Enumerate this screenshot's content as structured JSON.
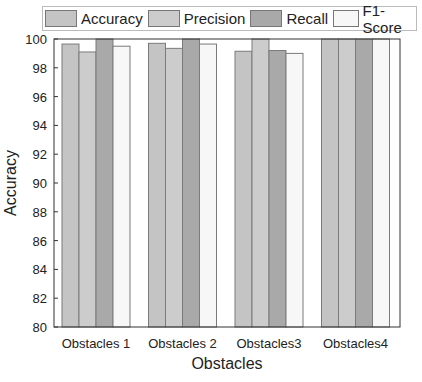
{
  "chart_data": {
    "type": "bar",
    "title": "",
    "xlabel": "Obstacles",
    "ylabel": "Accuracy",
    "ylim": [
      80,
      100
    ],
    "yticks": [
      80,
      82,
      84,
      86,
      88,
      90,
      92,
      94,
      96,
      98,
      100
    ],
    "grid": false,
    "legend_position": "top",
    "categories": [
      "Obstacles 1",
      "Obstacles 2",
      "Obstacles3",
      "Obstacles4"
    ],
    "series": [
      {
        "name": "Accuracy",
        "color": "#c4c4c4",
        "values": [
          99.65,
          99.7,
          99.15,
          100
        ]
      },
      {
        "name": "Precision",
        "color": "#cccccc",
        "values": [
          99.1,
          99.35,
          100,
          100
        ]
      },
      {
        "name": "Recall",
        "color": "#a9a9a9",
        "values": [
          100,
          100,
          99.2,
          100
        ]
      },
      {
        "name": "F1-Score",
        "color": "#f7f7f7",
        "values": [
          99.5,
          99.65,
          99.0,
          100
        ]
      }
    ]
  },
  "legend": {
    "items": [
      {
        "label": "Accuracy",
        "color": "#c4c4c4"
      },
      {
        "label": "Precision",
        "color": "#cccccc"
      },
      {
        "label": "Recall",
        "color": "#a9a9a9"
      },
      {
        "label": "F1-Score",
        "color": "#f7f7f7"
      }
    ]
  }
}
